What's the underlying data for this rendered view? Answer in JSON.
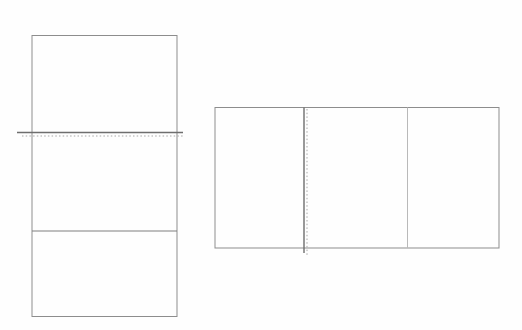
{
  "canvas": {
    "width": 522,
    "height": 330,
    "background": "#fefefe"
  },
  "colors": {
    "outline": "#8d8d8d",
    "fold_solid": "#6e6e6e",
    "divider_solid": "#7e7e7e",
    "divider_light": "#b9b9b9",
    "fold_dotted": "#a8a8a8"
  },
  "figures": [
    {
      "id": "vertical-trifold",
      "description": "portrait rectangle split into three stacked panels",
      "rect": {
        "x": 32,
        "y": 35.5,
        "width": 145,
        "height": 281
      },
      "outline_width": 1,
      "dividers": [
        {
          "name": "fold-divider",
          "orientation": "horizontal",
          "position": 132.5,
          "span": [
            17,
            183
          ],
          "color_key": "fold_solid",
          "width": 1.4,
          "dotted": {
            "position": 136,
            "span": [
              22,
              183
            ]
          }
        },
        {
          "name": "panel-divider",
          "orientation": "horizontal",
          "position": 231,
          "span": [
            32,
            177
          ],
          "color_key": "divider_solid",
          "width": 1.1
        }
      ]
    },
    {
      "id": "horizontal-trifold",
      "description": "landscape rectangle split into three side-by-side panels",
      "rect": {
        "x": 215,
        "y": 107.5,
        "width": 284,
        "height": 140.5
      },
      "outline_width": 1,
      "dividers": [
        {
          "name": "fold-divider",
          "orientation": "vertical",
          "position": 304,
          "span": [
            107.5,
            253
          ],
          "color_key": "fold_solid",
          "width": 1.4,
          "dotted": {
            "position": 307,
            "span": [
              109,
              257
            ]
          }
        },
        {
          "name": "panel-divider",
          "orientation": "vertical",
          "position": 407.5,
          "span": [
            107.5,
            248
          ],
          "color_key": "divider_light",
          "width": 1
        }
      ]
    }
  ]
}
